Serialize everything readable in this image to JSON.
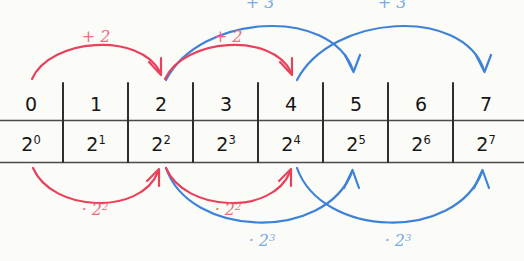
{
  "figure": {
    "background_color": "#fbfbf8",
    "red_color": "#e8415c",
    "blue_color": "#3d82d8",
    "red_label_color": "#ef6a80",
    "blue_label_color": "#7aa9e4"
  },
  "table": {
    "rows": [
      {
        "name": "exponent-row",
        "cells": [
          "0",
          "1",
          "2",
          "3",
          "4",
          "5",
          "6",
          "7"
        ]
      },
      {
        "name": "power-row",
        "base": "2",
        "cells": [
          "2",
          "2",
          "2",
          "2",
          "2",
          "2",
          "2",
          "2"
        ],
        "exponents": [
          "0",
          "1",
          "2",
          "3",
          "4",
          "5",
          "6",
          "7"
        ]
      }
    ]
  },
  "arrows_top": [
    {
      "id": "top-red-1",
      "color": "red",
      "label": "+ 2",
      "from_index": 0,
      "to_index": 2
    },
    {
      "id": "top-red-2",
      "color": "red",
      "label": "+ 2",
      "from_index": 2,
      "to_index": 4
    },
    {
      "id": "top-blue-1",
      "color": "blue",
      "label": "+ 3",
      "from_index": 2,
      "to_index": 5
    },
    {
      "id": "top-blue-2",
      "color": "blue",
      "label": "+ 3",
      "from_index": 4,
      "to_index": 7
    }
  ],
  "arrows_bottom": [
    {
      "id": "bottom-red-1",
      "color": "red",
      "label": "· 2",
      "label_sup": "2",
      "from_index": 0,
      "to_index": 2
    },
    {
      "id": "bottom-red-2",
      "color": "red",
      "label": "· 2",
      "label_sup": "2",
      "from_index": 2,
      "to_index": 4
    },
    {
      "id": "bottom-blue-1",
      "color": "blue",
      "label": "· 2",
      "label_sup": "3",
      "from_index": 2,
      "to_index": 5
    },
    {
      "id": "bottom-blue-2",
      "color": "blue",
      "label": "· 2",
      "label_sup": "3",
      "from_index": 4,
      "to_index": 7
    }
  ],
  "labels": {
    "top_red_1": "+ 2",
    "top_red_2": "+ 2",
    "top_blue_1": "+ 3",
    "top_blue_2": "+ 3",
    "bottom_red_1_base": "· 2",
    "bottom_red_1_sup": "2",
    "bottom_red_2_base": "· 2",
    "bottom_red_2_sup": "2",
    "bottom_blue_1_base": "· 2",
    "bottom_blue_1_sup": "3",
    "bottom_blue_2_base": "· 2",
    "bottom_blue_2_sup": "3"
  }
}
